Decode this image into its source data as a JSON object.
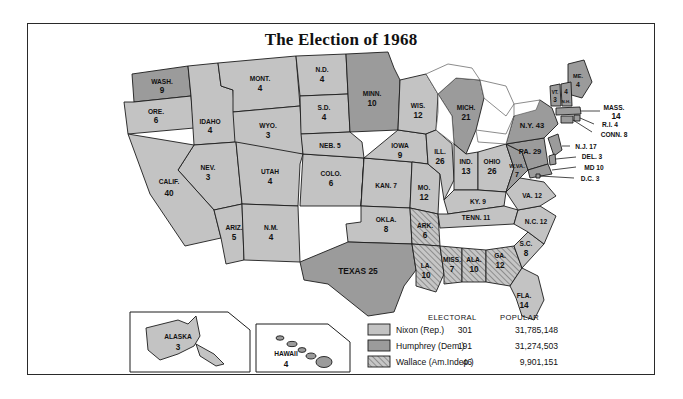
{
  "title": "The Election of 1968",
  "colors": {
    "nixon": "#c3c3c3",
    "humphrey": "#9b9b9b",
    "wallace_hatch": "#c3c3c3",
    "border": "#1c1c1c",
    "background": "#ffffff"
  },
  "legend": {
    "header_electoral": "ELECTORAL",
    "header_popular": "POPULAR",
    "rows": [
      {
        "candidate": "Nixon (Rep.)",
        "electoral": "301",
        "popular": "31,785,148",
        "fill": "nixon"
      },
      {
        "candidate": "Humphrey (Dem.)",
        "electoral": "191",
        "popular": "31,274,503",
        "fill": "humphrey"
      },
      {
        "candidate": "Wallace (Am.Indep.)",
        "electoral": "46",
        "popular": "9,901,151",
        "fill": "wallace"
      }
    ]
  },
  "insets": [
    {
      "name": "ALASKA",
      "votes": "3",
      "winner": "nixon"
    },
    {
      "name": "HAWAII",
      "votes": "4",
      "winner": "humphrey"
    }
  ],
  "states": [
    {
      "abbr": "WASH.",
      "votes": "9",
      "winner": "humphrey"
    },
    {
      "abbr": "ORE.",
      "votes": "6",
      "winner": "nixon"
    },
    {
      "abbr": "IDAHO",
      "votes": "4",
      "winner": "nixon"
    },
    {
      "abbr": "MONT.",
      "votes": "4",
      "winner": "nixon"
    },
    {
      "abbr": "WYO.",
      "votes": "3",
      "winner": "nixon"
    },
    {
      "abbr": "NEV.",
      "votes": "3",
      "winner": "nixon"
    },
    {
      "abbr": "UTAH",
      "votes": "4",
      "winner": "nixon"
    },
    {
      "abbr": "CALIF.",
      "votes": "40",
      "winner": "nixon"
    },
    {
      "abbr": "ARIZ.",
      "votes": "5",
      "winner": "nixon"
    },
    {
      "abbr": "COLO.",
      "votes": "6",
      "winner": "nixon"
    },
    {
      "abbr": "N.M.",
      "votes": "4",
      "winner": "nixon"
    },
    {
      "abbr": "N.D.",
      "votes": "4",
      "winner": "nixon"
    },
    {
      "abbr": "S.D.",
      "votes": "4",
      "winner": "nixon"
    },
    {
      "abbr": "NEB.",
      "votes": "5",
      "winner": "nixon"
    },
    {
      "abbr": "KAN.",
      "votes": "7",
      "winner": "nixon"
    },
    {
      "abbr": "OKLA.",
      "votes": "8",
      "winner": "nixon"
    },
    {
      "abbr": "TEXAS",
      "votes": "25",
      "winner": "humphrey"
    },
    {
      "abbr": "MINN.",
      "votes": "10",
      "winner": "humphrey"
    },
    {
      "abbr": "IOWA",
      "votes": "9",
      "winner": "nixon"
    },
    {
      "abbr": "MO.",
      "votes": "12",
      "winner": "nixon"
    },
    {
      "abbr": "ARK.",
      "votes": "6",
      "winner": "wallace"
    },
    {
      "abbr": "LA.",
      "votes": "10",
      "winner": "wallace"
    },
    {
      "abbr": "WIS.",
      "votes": "12",
      "winner": "nixon"
    },
    {
      "abbr": "ILL.",
      "votes": "26",
      "winner": "nixon"
    },
    {
      "abbr": "MISS.",
      "votes": "7",
      "winner": "wallace"
    },
    {
      "abbr": "MICH.",
      "votes": "21",
      "winner": "humphrey"
    },
    {
      "abbr": "IND.",
      "votes": "13",
      "winner": "nixon"
    },
    {
      "abbr": "OHIO",
      "votes": "26",
      "winner": "nixon"
    },
    {
      "abbr": "KY.",
      "votes": "9",
      "winner": "nixon"
    },
    {
      "abbr": "TENN.",
      "votes": "11",
      "winner": "nixon"
    },
    {
      "abbr": "ALA.",
      "votes": "10",
      "winner": "wallace"
    },
    {
      "abbr": "GA.",
      "votes": "12",
      "winner": "wallace"
    },
    {
      "abbr": "FLA.",
      "votes": "14",
      "winner": "nixon"
    },
    {
      "abbr": "S.C.",
      "votes": "8",
      "winner": "nixon"
    },
    {
      "abbr": "N.C.",
      "votes": "12",
      "winner": "nixon"
    },
    {
      "abbr": "VA.",
      "votes": "12",
      "winner": "nixon"
    },
    {
      "abbr": "W.VA.",
      "votes": "7",
      "winner": "humphrey"
    },
    {
      "abbr": "PA.",
      "votes": "29",
      "winner": "humphrey"
    },
    {
      "abbr": "N.Y.",
      "votes": "43",
      "winner": "humphrey"
    },
    {
      "abbr": "ME.",
      "votes": "4",
      "winner": "humphrey"
    },
    {
      "abbr": "VT.",
      "votes": "3",
      "winner": "humphrey"
    },
    {
      "abbr": "N.H.",
      "votes": "4",
      "winner": "humphrey"
    },
    {
      "abbr": "MASS.",
      "votes": "14",
      "winner": "humphrey"
    },
    {
      "abbr": "R.I.",
      "votes": "4",
      "winner": "humphrey"
    },
    {
      "abbr": "CONN.",
      "votes": "8",
      "winner": "humphrey"
    },
    {
      "abbr": "N.J.",
      "votes": "17",
      "winner": "humphrey"
    },
    {
      "abbr": "DEL.",
      "votes": "3",
      "winner": "humphrey"
    },
    {
      "abbr": "MD",
      "votes": "10",
      "winner": "humphrey"
    },
    {
      "abbr": "D.C.",
      "votes": "3",
      "winner": "humphrey"
    }
  ],
  "state_labels": {
    "wash": "WASH.",
    "wash_v": "9",
    "ore": "ORE.",
    "ore_v": "6",
    "idaho": "IDAHO",
    "idaho_v": "4",
    "mont": "MONT.",
    "mont_v": "4",
    "wyo": "WYO.",
    "wyo_v": "3",
    "nev": "NEV.",
    "nev_v": "3",
    "utah": "UTAH",
    "utah_v": "4",
    "calif": "CALIF.",
    "calif_v": "40",
    "ariz": "ARIZ.",
    "ariz_v": "5",
    "colo": "COLO.",
    "colo_v": "6",
    "nm": "N.M.",
    "nm_v": "4",
    "nd": "N.D.",
    "nd_v": "4",
    "sd": "S.D.",
    "sd_v": "4",
    "neb": "NEB. 5",
    "kan": "KAN. 7",
    "okla": "OKLA.",
    "okla_v": "8",
    "texas": "TEXAS 25",
    "minn": "MINN.",
    "minn_v": "10",
    "iowa": "IOWA",
    "iowa_v": "9",
    "mo": "MO.",
    "mo_v": "12",
    "ark": "ARK.",
    "ark_v": "6",
    "la": "LA.",
    "la_v": "10",
    "wis": "WIS.",
    "wis_v": "12",
    "ill": "ILL.",
    "ill_v": "26",
    "miss": "MISS.",
    "miss_v": "7",
    "mich": "MICH.",
    "mich_v": "21",
    "ind": "IND.",
    "ind_v": "13",
    "ohio": "OHIO",
    "ohio_v": "26",
    "ky": "KY. 9",
    "tenn": "TENN. 11",
    "ala": "ALA.",
    "ala_v": "10",
    "ga": "GA.",
    "ga_v": "12",
    "fla": "FLA.",
    "fla_v": "14",
    "sc": "S.C.",
    "sc_v": "8",
    "nc": "N.C. 12",
    "va": "VA. 12",
    "wva": "W.VA.",
    "wva_v": "7",
    "pa": "PA. 29",
    "ny": "N.Y. 43",
    "me": "ME.",
    "me_v": "4",
    "vt": "VT.",
    "vt_v": "3",
    "nh": "N.H.",
    "nh_v": "4",
    "mass": "MASS.",
    "mass_v": "14",
    "ri": "R.I. 4",
    "conn": "CONN. 8",
    "nj": "N.J. 17",
    "del": "DEL. 3",
    "md": "MD 10",
    "dc": "D.C. 3"
  }
}
